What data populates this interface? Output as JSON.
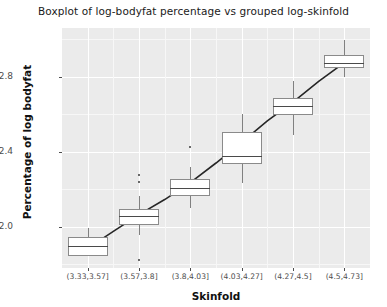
{
  "chart_data": {
    "type": "box",
    "title": "Boxplot of log-bodyfat percentage vs grouped log-skinfold",
    "xlabel": "Skinfold",
    "ylabel": "Percentage of log bodyfat",
    "grid": true,
    "legend": "none",
    "ylim": [
      1.78,
      3.06
    ],
    "yticks": [
      2.0,
      2.4,
      2.8
    ],
    "ytick_labels": [
      "2.0",
      "2.4",
      "2.8"
    ],
    "categories": [
      "(3.33,3.57]",
      "(3.57,3.8]",
      "(3.8,4.03]",
      "(4.03,4.27]",
      "(4.27,4.5]",
      "(4.5,4.73]"
    ],
    "boxes": [
      {
        "category": "(3.33,3.57]",
        "lower_whisker": 1.855,
        "q1": 1.845,
        "median": 1.895,
        "q3": 1.945,
        "upper_whisker": 1.995,
        "outliers": []
      },
      {
        "category": "(3.57,3.8]",
        "lower_whisker": 1.955,
        "q1": 2.01,
        "median": 2.055,
        "q3": 2.095,
        "upper_whisker": 2.165,
        "outliers": [
          2.24,
          2.275,
          1.825
        ]
      },
      {
        "category": "(3.8,4.03]",
        "lower_whisker": 2.1,
        "q1": 2.165,
        "median": 2.205,
        "q3": 2.255,
        "upper_whisker": 2.32,
        "outliers": [
          2.425
        ]
      },
      {
        "category": "(4.03,4.27]",
        "lower_whisker": 2.235,
        "q1": 2.335,
        "median": 2.38,
        "q3": 2.505,
        "upper_whisker": 2.6,
        "outliers": []
      },
      {
        "category": "(4.27,4.5]",
        "lower_whisker": 2.49,
        "q1": 2.595,
        "median": 2.645,
        "q3": 2.685,
        "upper_whisker": 2.775,
        "outliers": []
      },
      {
        "category": "(4.5,4.73]",
        "lower_whisker": 2.8,
        "q1": 2.845,
        "median": 2.875,
        "q3": 2.915,
        "upper_whisker": 2.995,
        "outliers": []
      }
    ],
    "trend_line": {
      "name": "fitted trend",
      "color": "#262626",
      "points": [
        {
          "x": 1.0,
          "y": 1.885
        },
        {
          "x": 1.5,
          "y": 1.975
        },
        {
          "x": 2.0,
          "y": 2.065
        },
        {
          "x": 2.5,
          "y": 2.145
        },
        {
          "x": 3.0,
          "y": 2.235
        },
        {
          "x": 3.5,
          "y": 2.34
        },
        {
          "x": 4.0,
          "y": 2.45
        },
        {
          "x": 4.5,
          "y": 2.565
        },
        {
          "x": 5.0,
          "y": 2.665
        },
        {
          "x": 5.5,
          "y": 2.775
        },
        {
          "x": 6.0,
          "y": 2.875
        }
      ]
    },
    "colors": {
      "panel_background": "#ebebeb",
      "grid_major": "#ffffff",
      "grid_minor": "#f7f7f7",
      "box_fill": "#ffffff",
      "box_stroke": "#8a8a8a",
      "median": "#4a4a4a",
      "trend": "#262626",
      "text": "#1a1a1a",
      "tick_text": "#4d4d4d"
    }
  }
}
